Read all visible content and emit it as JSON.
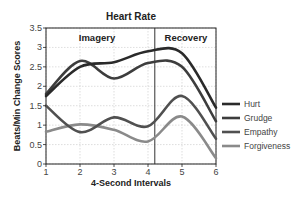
{
  "chart_data": {
    "type": "line",
    "title": "Heart Rate",
    "xlabel": "4-Second Intervals",
    "ylabel": "Beats/Min Change Scores",
    "x": [
      1,
      2,
      3,
      4,
      5,
      6
    ],
    "xlim": [
      1,
      6
    ],
    "ylim": [
      0,
      3.5
    ],
    "xticks": [
      "1",
      "2",
      "3",
      "4",
      "5",
      "6"
    ],
    "yticks": [
      "0",
      "0.5",
      "1",
      "1.5",
      "2",
      "2.5",
      "3",
      "3.5"
    ],
    "grid": true,
    "legend_position": "right",
    "annotations": [
      {
        "text": "Imagery",
        "region": [
          1,
          4.2
        ]
      },
      {
        "text": "Recovery",
        "region": [
          4.2,
          6
        ]
      }
    ],
    "divider_x": 4.2,
    "series": [
      {
        "name": "Hurt",
        "color": "#2a2a2a",
        "values": [
          1.75,
          2.5,
          2.62,
          2.9,
          2.85,
          1.45
        ]
      },
      {
        "name": "Grudge",
        "color": "#3d3d3d",
        "values": [
          1.8,
          2.65,
          2.2,
          2.6,
          2.5,
          1.1
        ]
      },
      {
        "name": "Empathy",
        "color": "#505050",
        "values": [
          1.5,
          0.82,
          1.2,
          0.97,
          1.75,
          0.65
        ]
      },
      {
        "name": "Forgiveness",
        "color": "#8a8a8a",
        "values": [
          0.83,
          1.02,
          0.88,
          0.58,
          1.22,
          0.15
        ]
      }
    ]
  }
}
